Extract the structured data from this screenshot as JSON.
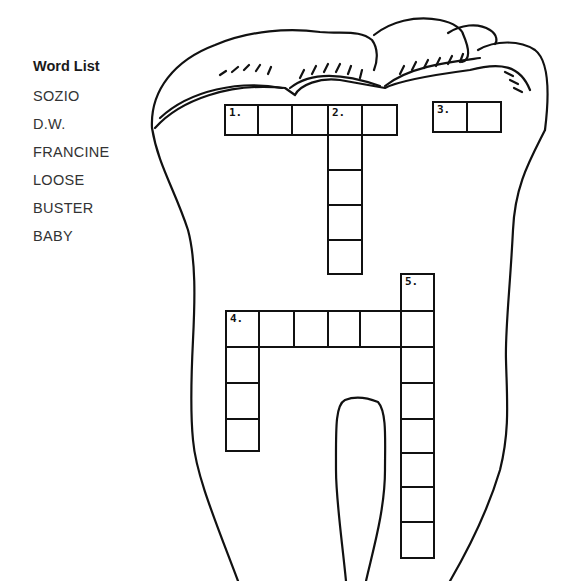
{
  "word_list": {
    "title": "Word List",
    "words": [
      "SOZIO",
      "D.W.",
      "FRANCINE",
      "LOOSE",
      "BUSTER",
      "BABY"
    ]
  },
  "puzzle": {
    "shape": "tooth-outline",
    "clues": [
      {
        "number": "1.",
        "direction": "across",
        "length": 5
      },
      {
        "number": "2.",
        "direction": "down",
        "length": 5
      },
      {
        "number": "3.",
        "direction": "across",
        "length": 2
      },
      {
        "number": "4.",
        "direction": "across",
        "length": 6
      },
      {
        "number": "4.",
        "direction": "down",
        "length": 4
      },
      {
        "number": "5.",
        "direction": "down",
        "length": 9
      }
    ]
  }
}
